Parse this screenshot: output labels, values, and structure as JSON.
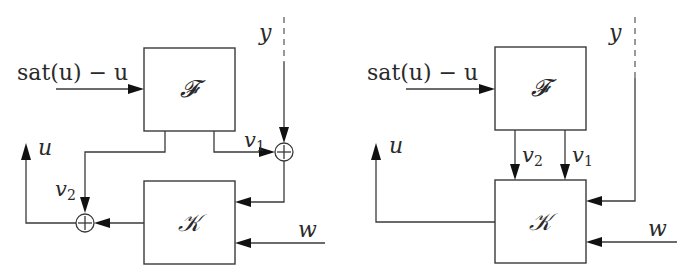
{
  "figure": {
    "left_diagram": {
      "blocks": [
        {
          "id": "F",
          "label": "𝓕"
        },
        {
          "id": "K",
          "label": "𝒦"
        }
      ],
      "signals": {
        "input_F": "sat(u) − u",
        "y": "y",
        "v1": "v",
        "v1_sub": "1",
        "v2": "v",
        "v2_sub": "2",
        "u": "u",
        "w": "w"
      },
      "summing_junctions": [
        "sum-v1-y",
        "sum-v2-K"
      ],
      "sum_symbol": "+"
    },
    "right_diagram": {
      "blocks": [
        {
          "id": "F",
          "label": "𝓕"
        },
        {
          "id": "K",
          "label": "𝒦"
        }
      ],
      "signals": {
        "input_F": "sat(u) − u",
        "y": "y",
        "v1": "v",
        "v1_sub": "1",
        "v2": "v",
        "v2_sub": "2",
        "u": "u",
        "w": "w"
      }
    }
  }
}
